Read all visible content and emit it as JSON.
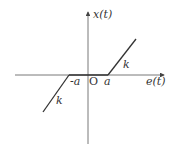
{
  "diagram": {
    "type": "dead-zone nonlinearity characteristic",
    "axes": {
      "y_label": "x(t)",
      "x_label": "e(t)",
      "origin_label": "O"
    },
    "ticks": {
      "negative": "-a",
      "positive": "a"
    },
    "slopes": {
      "right": "k",
      "left": "k"
    },
    "colors": {
      "line": "#333333",
      "axis": "#555555"
    }
  }
}
